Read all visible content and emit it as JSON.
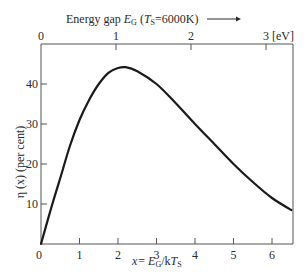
{
  "chart_data": {
    "type": "line",
    "title": "",
    "top_axis": {
      "label": "Energy gap E_G (T_S=6000K)",
      "label_parts": {
        "prefix": "Energy gap ",
        "E": "E",
        "Esub": "G",
        "open": " (",
        "T": "T",
        "Tsub": "S",
        "eq": "=6000K)"
      },
      "ticks": [
        "0",
        "1",
        "2",
        "3 [eV]"
      ],
      "tick_values": [
        0,
        1,
        2,
        3
      ],
      "unit": "eV"
    },
    "xlabel": "x = E_G/kT_S",
    "xlabel_parts": {
      "x": "x",
      "eq": "= ",
      "E": "E",
      "Esub": "G",
      "slash": "/k",
      "T": "T",
      "Tsub": "S"
    },
    "ylabel": "η (x) (per cent)",
    "x_ticks": [
      "0",
      "1",
      "2",
      "3",
      "4",
      "5",
      "6"
    ],
    "y_ticks": [
      "10",
      "20",
      "30",
      "40"
    ],
    "y_zero_label": "0",
    "xlim": [
      0,
      6.55
    ],
    "ylim": [
      0,
      49
    ],
    "grid": false,
    "legend": null,
    "series": [
      {
        "name": "η(x)",
        "x": [
          0,
          0.25,
          0.5,
          0.75,
          1.0,
          1.25,
          1.5,
          1.75,
          2.0,
          2.2,
          2.5,
          3.0,
          3.5,
          4.0,
          4.5,
          5.0,
          5.5,
          6.0,
          6.5
        ],
        "values": [
          0,
          8.5,
          16.5,
          24.5,
          31,
          36,
          40,
          42.8,
          44,
          44.2,
          43.2,
          40,
          35.2,
          30,
          25,
          20,
          15.5,
          11.5,
          8.5
        ]
      }
    ]
  }
}
